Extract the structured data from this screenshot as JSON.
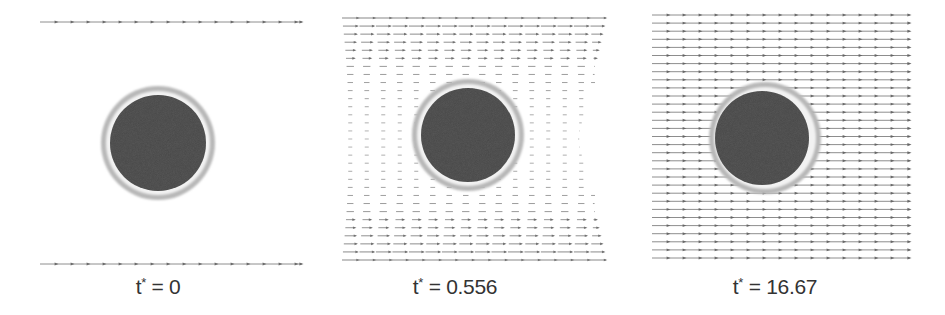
{
  "figure": {
    "colors": {
      "streamline": "#7a7a7a",
      "arrowhead": "#606060",
      "particle_core": "#585858",
      "particle_ring": "#b8b8b8",
      "particle_gap": "#f2f2f2",
      "caption": "#333333"
    },
    "panels": [
      {
        "id": "panel-t0",
        "time_label": "t",
        "time_symbol": "*",
        "time_value": "= 0",
        "caption_x": 158,
        "caption_y": 275,
        "field": {
          "type": "walls-only",
          "x_start": 40,
          "x_end": 302,
          "rows_y": [
            22,
            264
          ],
          "arrow_spacing": 16
        },
        "particle": {
          "cx": 158,
          "cy": 143,
          "core_r": 48,
          "ring_inner_r": 52,
          "ring_outer_r": 57
        }
      },
      {
        "id": "panel-t0556",
        "time_label": "t",
        "time_symbol": "*",
        "time_value": "= 0.556",
        "caption_x": 455,
        "caption_y": 275,
        "field": {
          "type": "developing",
          "x_start": 342,
          "x_end": 606,
          "y_start": 18,
          "y_end": 260,
          "rows": 31,
          "cols": 16
        },
        "particle": {
          "cx": 468,
          "cy": 135,
          "core_r": 47,
          "ring_inner_r": 51,
          "ring_outer_r": 56
        }
      },
      {
        "id": "panel-t1667",
        "time_label": "t",
        "time_symbol": "*",
        "time_value": "= 16.67",
        "caption_x": 775,
        "caption_y": 275,
        "field": {
          "type": "uniform",
          "x_start": 652,
          "x_end": 910,
          "y_start": 15,
          "y_end": 258,
          "rows": 31,
          "arrow_spacing": 16
        },
        "particle": {
          "cx": 762,
          "cy": 138,
          "core_r": 47,
          "ring_inner_r": 51,
          "ring_outer_r": 56,
          "ring_offset_x": 3
        }
      }
    ]
  }
}
